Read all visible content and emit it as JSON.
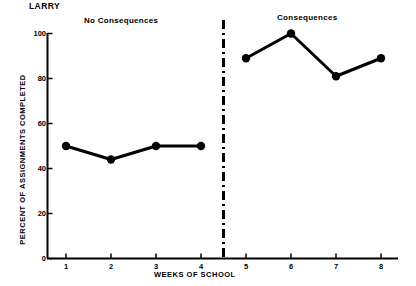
{
  "chart_data": {
    "type": "line",
    "title": "LARRY",
    "xlabel": "WEEKS OF SCHOOL",
    "ylabel": "PERCENT OF ASSIGNMENTS COMPLETED",
    "xlim": [
      0.4,
      8.6
    ],
    "ylim": [
      0,
      100
    ],
    "grid": false,
    "legend": "none",
    "x": [
      1,
      2,
      3,
      4,
      5,
      6,
      7,
      8
    ],
    "xticks": [
      "1",
      "2",
      "3",
      "4",
      "5",
      "6",
      "7",
      "8"
    ],
    "yticks": [
      "0",
      "20",
      "40",
      "60",
      "80",
      "100"
    ],
    "ytick_values": [
      0,
      20,
      40,
      60,
      80,
      100
    ],
    "series": [
      {
        "name": "No Consequences",
        "x": [
          1,
          2,
          3,
          4
        ],
        "values": [
          50,
          44,
          50,
          50
        ]
      },
      {
        "name": "Consequences",
        "x": [
          5,
          6,
          7,
          8
        ],
        "values": [
          89,
          100,
          81,
          89
        ]
      }
    ],
    "annotations": [
      {
        "text": "No Consequences",
        "phase": 1
      },
      {
        "text": "Consequences",
        "phase": 2
      }
    ],
    "phase_divider": {
      "x": 4.5,
      "style": "dash-dot"
    },
    "colors": {
      "line": "#000000",
      "marker": "#000000",
      "axis": "#000000",
      "background": "#ffffff"
    }
  }
}
